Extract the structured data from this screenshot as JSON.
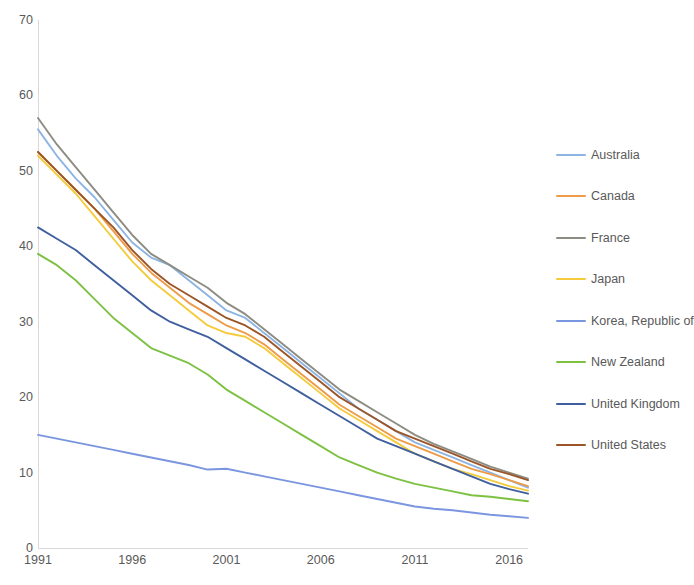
{
  "chart_data": {
    "type": "line",
    "title": "",
    "subtitle": "",
    "xlabel": "",
    "ylabel": "",
    "xlim": [
      1991,
      2017
    ],
    "ylim": [
      0,
      70
    ],
    "grid": false,
    "legend_position": "right",
    "x": [
      1991,
      1992,
      1993,
      1994,
      1995,
      1996,
      1997,
      1998,
      1999,
      2000,
      2001,
      2002,
      2003,
      2004,
      2005,
      2006,
      2007,
      2008,
      2009,
      2010,
      2011,
      2012,
      2013,
      2014,
      2015,
      2016,
      2017
    ],
    "xticks": [
      1991,
      1996,
      2001,
      2006,
      2011,
      2016
    ],
    "xtick_labels": [
      "1991",
      "1996",
      "2001",
      "2006",
      "2011",
      "2016"
    ],
    "yticks": [
      0,
      10,
      20,
      30,
      40,
      50,
      60,
      70
    ],
    "ytick_labels": [
      "0",
      "10",
      "20",
      "30",
      "40",
      "50",
      "60",
      "70"
    ],
    "series": [
      {
        "name": "Australia",
        "color": "#8eb4e3",
        "values": [
          55.5,
          52.0,
          49.0,
          46.5,
          43.5,
          40.5,
          38.5,
          37.5,
          35.5,
          33.5,
          31.5,
          30.5,
          28.5,
          26.5,
          24.5,
          22.5,
          20.5,
          18.5,
          17.0,
          15.5,
          14.0,
          13.0,
          12.0,
          11.0,
          10.0,
          9.0,
          8.0
        ]
      },
      {
        "name": "Canada",
        "color": "#ed9b48",
        "values": [
          52.5,
          50.0,
          47.5,
          45.0,
          42.0,
          39.0,
          36.5,
          34.5,
          32.5,
          31.0,
          29.5,
          28.5,
          27.0,
          25.0,
          23.0,
          21.0,
          19.0,
          17.5,
          16.0,
          14.5,
          13.5,
          12.5,
          11.5,
          10.5,
          9.8,
          9.0,
          8.2
        ]
      },
      {
        "name": "France",
        "color": "#8c8c83",
        "values": [
          57.0,
          53.5,
          50.5,
          47.5,
          44.5,
          41.5,
          39.0,
          37.5,
          36.0,
          34.5,
          32.5,
          31.0,
          29.0,
          27.0,
          25.0,
          23.0,
          21.0,
          19.5,
          18.0,
          16.5,
          15.0,
          13.8,
          12.8,
          11.8,
          10.8,
          10.0,
          9.2
        ]
      },
      {
        "name": "Japan",
        "color": "#f4cb3c",
        "values": [
          52.0,
          49.5,
          47.0,
          44.0,
          41.0,
          38.0,
          35.5,
          33.5,
          31.5,
          29.5,
          28.5,
          28.0,
          26.5,
          24.5,
          22.5,
          20.5,
          18.5,
          17.0,
          15.5,
          14.0,
          12.5,
          11.5,
          10.5,
          9.8,
          9.0,
          8.2,
          7.6
        ]
      },
      {
        "name": "Korea, Republic of",
        "color": "#7b96e0",
        "values": [
          15.0,
          14.5,
          14.0,
          13.5,
          13.0,
          12.5,
          12.0,
          11.5,
          11.0,
          10.4,
          10.5,
          10.0,
          9.5,
          9.0,
          8.5,
          8.0,
          7.5,
          7.0,
          6.5,
          6.0,
          5.5,
          5.2,
          5.0,
          4.7,
          4.4,
          4.2,
          4.0
        ]
      },
      {
        "name": "New Zealand",
        "color": "#7dc142"
      },
      {
        "name": "United Kingdom",
        "color": "#3f5f9e",
        "values": [
          42.5,
          41.0,
          39.5,
          37.5,
          35.5,
          33.5,
          31.5,
          30.0,
          29.0,
          28.0,
          26.5,
          25.0,
          23.5,
          22.0,
          20.5,
          19.0,
          17.5,
          16.0,
          14.5,
          13.5,
          12.5,
          11.5,
          10.5,
          9.5,
          8.5,
          7.8,
          7.2
        ]
      },
      {
        "name": "United States",
        "color": "#9b5527",
        "values": [
          52.5,
          50.0,
          47.5,
          45.0,
          42.5,
          39.5,
          37.0,
          35.0,
          33.5,
          32.0,
          30.5,
          29.5,
          28.0,
          26.0,
          24.0,
          22.0,
          20.0,
          18.5,
          17.0,
          15.5,
          14.5,
          13.5,
          12.5,
          11.5,
          10.5,
          9.8,
          9.0
        ]
      }
    ],
    "series_newzealand_values": [
      39.0,
      37.5,
      35.5,
      33.0,
      30.5,
      28.5,
      26.5,
      25.5,
      24.5,
      23.0,
      21.0,
      19.5,
      18.0,
      16.5,
      15.0,
      13.5,
      12.0,
      11.0,
      10.0,
      9.2,
      8.5,
      8.0,
      7.5,
      7.0,
      6.8,
      6.5,
      6.2
    ]
  },
  "legend": {
    "items": [
      {
        "label": "Australia",
        "color": "#8eb4e3"
      },
      {
        "label": "Canada",
        "color": "#ed9b48"
      },
      {
        "label": "France",
        "color": "#8c8c83"
      },
      {
        "label": "Japan",
        "color": "#f4cb3c"
      },
      {
        "label": "Korea, Republic of",
        "color": "#7b96e0"
      },
      {
        "label": "New Zealand",
        "color": "#7dc142"
      },
      {
        "label": "United Kingdom",
        "color": "#3f5f9e"
      },
      {
        "label": "United States",
        "color": "#9b5527"
      }
    ]
  }
}
